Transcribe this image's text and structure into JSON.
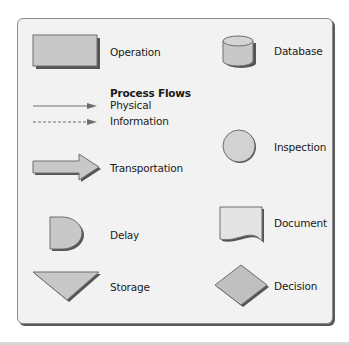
{
  "legend": {
    "operation": "Operation",
    "database": "Database",
    "process_flows": {
      "title": "Process Flows",
      "physical": "Physical",
      "information": "Information"
    },
    "inspection": "Inspection",
    "transportation": "Transportation",
    "delay": "Delay",
    "document": "Document",
    "storage": "Storage",
    "decision": "Decision"
  },
  "colors": {
    "shape_fill": "#c8c8c8",
    "shape_stroke": "#6e6e6e",
    "shadow": "#555555",
    "panel_bg": "#f2f2f2"
  }
}
